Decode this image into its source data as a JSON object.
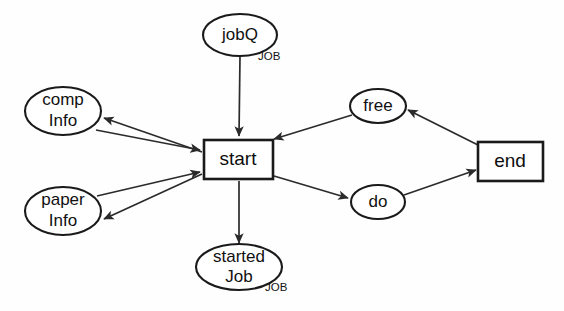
{
  "diagram": {
    "background_color": "#fefefe",
    "stroke_color": "#1a1a1a",
    "nodes": [
      {
        "id": "jobQ",
        "label": "jobQ",
        "shape": "ellipse",
        "cx": 240,
        "cy": 35,
        "rx": 37,
        "ry": 21,
        "type_label": "JOB",
        "type_x": 258,
        "type_y": 57
      },
      {
        "id": "compInfo",
        "label_line1": "comp",
        "label_line2": "Info",
        "shape": "ellipse",
        "cx": 63,
        "cy": 111,
        "rx": 38,
        "ry": 24
      },
      {
        "id": "paperInfo",
        "label_line1": "paper",
        "label_line2": "Info",
        "shape": "ellipse",
        "cx": 63,
        "cy": 211,
        "rx": 38,
        "ry": 24
      },
      {
        "id": "start",
        "label": "start",
        "shape": "rect",
        "x": 204,
        "y": 140,
        "w": 69,
        "h": 39
      },
      {
        "id": "startedJob",
        "label_line1": "started",
        "label_line2": "Job",
        "shape": "ellipse",
        "cx": 239,
        "cy": 267,
        "rx": 43,
        "ry": 23,
        "type_label": "JOB",
        "type_x": 265,
        "type_y": 288
      },
      {
        "id": "free",
        "label": "free",
        "shape": "ellipse",
        "cx": 378,
        "cy": 106,
        "rx": 28,
        "ry": 17
      },
      {
        "id": "do",
        "label": "do",
        "shape": "ellipse",
        "cx": 378,
        "cy": 202,
        "rx": 27,
        "ry": 17
      },
      {
        "id": "end",
        "label": "end",
        "shape": "rect",
        "x": 478,
        "y": 142,
        "w": 65,
        "h": 39
      }
    ],
    "edges": [
      {
        "id": "jobQ-to-start",
        "from": "jobQ",
        "to": "start",
        "arrowhead": "end"
      },
      {
        "id": "start-to-compInfo",
        "from": "start",
        "to": "compInfo",
        "arrowhead": "end"
      },
      {
        "id": "compInfo-to-start",
        "from": "compInfo",
        "to": "start",
        "arrowhead": "end"
      },
      {
        "id": "start-to-paperInfo",
        "from": "start",
        "to": "paperInfo",
        "arrowhead": "end"
      },
      {
        "id": "paperInfo-to-start",
        "from": "paperInfo",
        "to": "start",
        "arrowhead": "end"
      },
      {
        "id": "start-to-startedJob",
        "from": "start",
        "to": "startedJob",
        "arrowhead": "end"
      },
      {
        "id": "free-to-start",
        "from": "free",
        "to": "start",
        "arrowhead": "end"
      },
      {
        "id": "start-to-do",
        "from": "start",
        "to": "do",
        "arrowhead": "end"
      },
      {
        "id": "do-to-end",
        "from": "do",
        "to": "end",
        "arrowhead": "end"
      },
      {
        "id": "end-to-free",
        "from": "end",
        "to": "free",
        "arrowhead": "end"
      }
    ]
  }
}
